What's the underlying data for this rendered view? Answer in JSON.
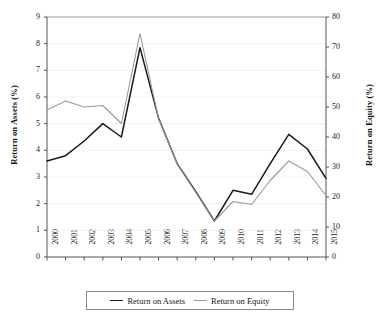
{
  "chart_data": {
    "type": "line",
    "title": "",
    "xlabel": "",
    "ylabel": "Return on Assets (%)",
    "ylabel_right": "Return on Equity (%)",
    "categories": [
      "2000",
      "2001",
      "2002",
      "2003",
      "2004",
      "2005",
      "2006",
      "2007",
      "2008",
      "2009",
      "2010",
      "2011",
      "2012",
      "2013",
      "2014",
      "2015"
    ],
    "ylim": [
      0,
      9
    ],
    "ylim_right": [
      0,
      80
    ],
    "yticks": [
      "0",
      "1",
      "2",
      "3",
      "4",
      "5",
      "6",
      "7",
      "8",
      "9"
    ],
    "yticks_right": [
      "0",
      "10",
      "20",
      "30",
      "40",
      "50",
      "60",
      "70",
      "80"
    ],
    "grid": true,
    "legend_position": "bottom",
    "series": [
      {
        "name": "Return on Assets",
        "axis": "left",
        "color": "#1a1a1a",
        "values": [
          3.6,
          3.8,
          4.35,
          5.0,
          4.5,
          7.85,
          5.2,
          3.5,
          2.45,
          1.35,
          2.5,
          2.35,
          3.5,
          4.6,
          4.05,
          2.95
        ]
      },
      {
        "name": "Return on Equity",
        "axis": "right",
        "color": "#9a9a9a",
        "values": [
          49.0,
          52.0,
          50.0,
          50.5,
          44.5,
          74.5,
          46.0,
          31.0,
          21.5,
          12.0,
          18.5,
          17.5,
          25.5,
          32.0,
          28.5,
          20.5
        ]
      }
    ]
  },
  "legend": {
    "items": [
      {
        "label": "Return on Assets",
        "color": "#1a1a1a"
      },
      {
        "label": "Return on Equity",
        "color": "#9a9a9a"
      }
    ]
  },
  "axes": {
    "left_title": "Return on Assets (%)",
    "right_title": "Return on Equity (%)"
  }
}
